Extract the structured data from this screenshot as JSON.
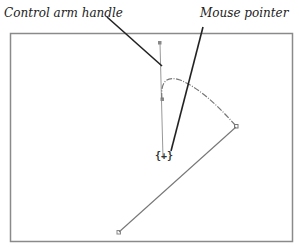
{
  "callouts": {
    "control_arm_handle": "Control arm handle",
    "mouse_pointer": "Mouse pointer"
  },
  "canvas": {
    "border_color": "#8a8a8a",
    "curve_color": "#777777"
  },
  "pointer_glyph": "{+}"
}
